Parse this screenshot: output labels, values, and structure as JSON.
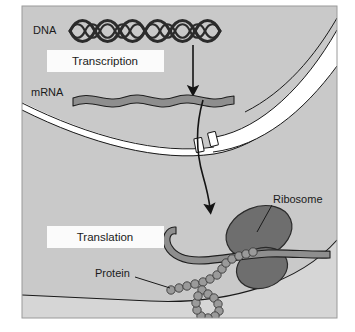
{
  "figure": {
    "caption": ""
  },
  "labels": {
    "dna": "DNA",
    "transcription": "Transcription",
    "mrna": "mRNA",
    "translation": "Translation",
    "ribosome": "Ribosome",
    "protein": "Protein"
  },
  "colors": {
    "cytoplasm": "#c9c9c9",
    "nucleus_interior": "#c9c9c9",
    "outside_cell": "#d8d8d8",
    "membrane_band": "#ffffff",
    "outline": "#1a1a1a",
    "dna_strand": "#2b2b2b",
    "mrna_strand": "#8e8e8e",
    "ribosome_body": "#6e6e6e",
    "protein_bead": "#9a9a9a",
    "label_box": "#fbfbfb",
    "text": "#1a1a1a",
    "page_background": "#ffffff"
  },
  "structures": [
    {
      "name": "dna-double-helix",
      "label": "DNA"
    },
    {
      "name": "transcription-arrow",
      "label": ""
    },
    {
      "name": "mrna-strand",
      "label": "mRNA"
    },
    {
      "name": "nuclear-envelope",
      "label": ""
    },
    {
      "name": "nuclear-pore",
      "label": ""
    },
    {
      "name": "mrna-export-arrow",
      "label": ""
    },
    {
      "name": "ribosome-large-subunit",
      "label": "Ribosome"
    },
    {
      "name": "ribosome-small-subunit",
      "label": "Ribosome"
    },
    {
      "name": "protein-chain",
      "label": "Protein"
    },
    {
      "name": "cell-membrane",
      "label": ""
    }
  ],
  "leader_lines": [
    {
      "from": "ribosome-label",
      "to": "ribosome-large-subunit"
    },
    {
      "from": "protein-label",
      "to": "protein-chain"
    }
  ]
}
